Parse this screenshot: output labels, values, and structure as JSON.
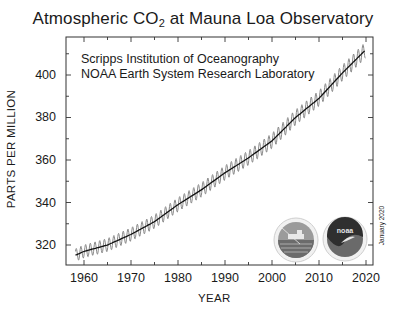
{
  "title": {
    "prefix": "Atmospheric CO",
    "subscript": "2",
    "suffix": " at Mauna Loa Observatory"
  },
  "credits": [
    "Scripps Institution of Oceanography",
    "NOAA Earth System Research Laboratory"
  ],
  "date_stamp": "January 2020",
  "logos": [
    "scripps-logo",
    "noaa-logo"
  ],
  "noaa_logo_text": "noaa",
  "chart_data": {
    "type": "line",
    "title": "Atmospheric CO2 at Mauna Loa Observatory",
    "xlabel": "YEAR",
    "ylabel": "PARTS PER MILLION",
    "xlim": [
      1956,
      2021
    ],
    "ylim": [
      311,
      418
    ],
    "x_ticks": [
      1960,
      1970,
      1980,
      1990,
      2000,
      2010,
      2020
    ],
    "y_ticks": [
      320,
      340,
      360,
      380,
      400
    ],
    "grid": false,
    "legend": null,
    "annotations": [
      "Scripps Institution of Oceanography",
      "NOAA Earth System Research Laboratory",
      "January 2020"
    ],
    "series": [
      {
        "name": "Monthly CO2 (seasonal cycle)",
        "style": "gray oscillating line, ~6 ppm peak-to-peak",
        "x": [
          1958,
          1960,
          1965,
          1970,
          1975,
          1980,
          1985,
          1990,
          1995,
          2000,
          2005,
          2010,
          2015,
          2020
        ],
        "values": [
          315,
          317,
          320,
          325,
          331,
          339,
          346,
          354,
          361,
          369,
          380,
          389,
          401,
          413
        ]
      },
      {
        "name": "Seasonally adjusted trend",
        "style": "black line",
        "x": [
          1958,
          1960,
          1965,
          1970,
          1975,
          1980,
          1985,
          1990,
          1995,
          2000,
          2005,
          2010,
          2015,
          2020
        ],
        "values": [
          315,
          317,
          320,
          325,
          331,
          339,
          346,
          354,
          361,
          369,
          380,
          389,
          401,
          412
        ]
      }
    ]
  }
}
